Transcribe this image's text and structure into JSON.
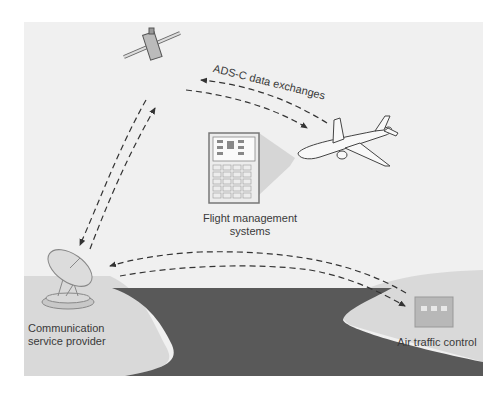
{
  "diagram": {
    "type": "communication-network",
    "background_color": "#f0f0f0",
    "land_color": "#d9d9d9",
    "sea_color": "#595959",
    "arrow_color": "#333333",
    "nodes": [
      {
        "id": "satellite",
        "label": ""
      },
      {
        "id": "aircraft",
        "label": ""
      },
      {
        "id": "fms",
        "label_line1": "Flight management",
        "label_line2": "systems"
      },
      {
        "id": "csp",
        "label_line1": "Communication",
        "label_line2": "service provider"
      },
      {
        "id": "atc",
        "label": "Air traffic control"
      }
    ],
    "edges": [
      {
        "from": "satellite",
        "to": "aircraft",
        "label": "ADS-C data exchanges",
        "bidirectional": true,
        "style": "dashed"
      },
      {
        "from": "csp",
        "to": "satellite",
        "bidirectional": true,
        "style": "dashed"
      },
      {
        "from": "csp",
        "to": "atc",
        "bidirectional": true,
        "style": "dashed"
      },
      {
        "from": "fms",
        "to": "aircraft",
        "style": "projection"
      }
    ],
    "edge_label_adsc": "ADS-C data exchanges"
  }
}
